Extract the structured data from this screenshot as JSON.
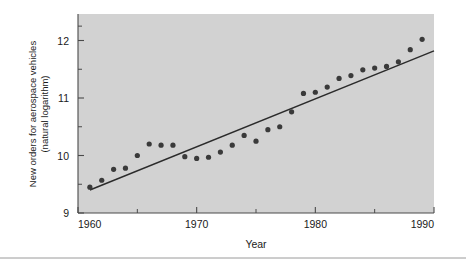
{
  "chart_data": {
    "type": "scatter",
    "title": "",
    "subtitle": "",
    "xlabel": "Year",
    "ylabel": "New orders for aerospace vehicles (natural logarithm)",
    "ylabel_line1": "New orders for aerospace vehicles",
    "ylabel_line2": "(natural logarithm)",
    "xlim": [
      1960,
      1990
    ],
    "ylim": [
      9,
      12.45
    ],
    "grid": false,
    "legend": null,
    "x_major_ticks": [
      1960,
      1970,
      1980,
      1990
    ],
    "x_major_tick_labels": [
      "1960",
      "1970",
      "1980",
      "1990"
    ],
    "x_minor_ticks": [
      1965,
      1975,
      1985
    ],
    "y_major_ticks": [
      9,
      10,
      11,
      12
    ],
    "y_major_tick_labels": [
      "9",
      "10",
      "11",
      "12"
    ],
    "y_minor_ticks": [
      9.5,
      10.5,
      11.5,
      12.25
    ],
    "x": [
      1961,
      1962,
      1963,
      1964,
      1965,
      1966,
      1967,
      1968,
      1969,
      1970,
      1971,
      1972,
      1973,
      1974,
      1975,
      1976,
      1977,
      1978,
      1979,
      1980,
      1981,
      1982,
      1983,
      1984,
      1985,
      1986,
      1987,
      1988,
      1989
    ],
    "values": [
      9.45,
      9.57,
      9.76,
      9.78,
      10.0,
      10.2,
      10.18,
      10.18,
      9.98,
      9.95,
      9.97,
      10.06,
      10.18,
      10.35,
      10.25,
      10.45,
      10.5,
      10.76,
      11.08,
      11.1,
      11.19,
      11.34,
      11.39,
      11.49,
      11.52,
      11.55,
      11.63,
      11.84,
      12.02
    ],
    "series": [
      {
        "name": "New orders for aerospace vehicles",
        "type": "scatter",
        "x": [
          1961,
          1962,
          1963,
          1964,
          1965,
          1966,
          1967,
          1968,
          1969,
          1970,
          1971,
          1972,
          1973,
          1974,
          1975,
          1976,
          1977,
          1978,
          1979,
          1980,
          1981,
          1982,
          1983,
          1984,
          1985,
          1986,
          1987,
          1988,
          1989
        ],
        "values": [
          9.45,
          9.57,
          9.76,
          9.78,
          10.0,
          10.2,
          10.18,
          10.18,
          9.98,
          9.95,
          9.97,
          10.06,
          10.18,
          10.35,
          10.25,
          10.45,
          10.5,
          10.76,
          11.08,
          11.1,
          11.19,
          11.34,
          11.39,
          11.49,
          11.52,
          11.55,
          11.63,
          11.84,
          12.02
        ],
        "marker": "filled-circle",
        "color": "#3a3a3a"
      },
      {
        "name": "Fitted trend line",
        "type": "line",
        "x": [
          1961,
          1990
        ],
        "values": [
          9.4,
          11.82
        ],
        "color": "#2b2b2b"
      }
    ],
    "colors": {
      "plot_background": "#d2d2d2",
      "figure_background": "#ffffff",
      "marker": "#3a3a3a",
      "trend_line": "#2b2b2b",
      "axis": "#4a4a4a",
      "text": "#1a1a1a"
    }
  }
}
